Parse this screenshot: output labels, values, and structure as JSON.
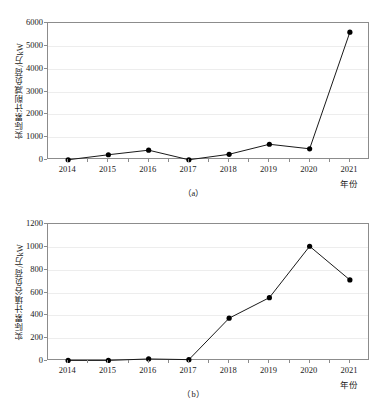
{
  "figure": {
    "background": "#ffffff",
    "line_color": "#1a1a1a",
    "marker_color": "#000000",
    "grid_color": "#ededed",
    "axis_color": "#8c8c8c"
  },
  "chart_data": [
    {
      "id": "panel-a",
      "type": "line",
      "title": "",
      "caption": "（a）",
      "xlabel": "年份",
      "ylabel": "实际累计削减负荷/万kW",
      "categories": [
        "2014",
        "2015",
        "2016",
        "2017",
        "2018",
        "2019",
        "2020",
        "2021"
      ],
      "values": [
        10,
        230,
        430,
        10,
        250,
        690,
        490,
        5600
      ],
      "ylim": [
        0,
        6000
      ],
      "yticks": [
        0,
        1000,
        2000,
        3000,
        4000,
        5000,
        6000
      ],
      "ytick_labels": [
        "0",
        "1000",
        "2000",
        "3000",
        "4000",
        "5000",
        "6000"
      ],
      "grid": true,
      "legend": "none",
      "marker": "circle"
    },
    {
      "id": "panel-b",
      "type": "line",
      "title": "",
      "caption": "（b）",
      "xlabel": "年份",
      "ylabel": "实际累计填谷负荷/万kW",
      "categories": [
        "2014",
        "2015",
        "2016",
        "2017",
        "2018",
        "2019",
        "2020",
        "2021"
      ],
      "values": [
        5,
        5,
        18,
        12,
        375,
        555,
        1005,
        710
      ],
      "ylim": [
        0,
        1200
      ],
      "yticks": [
        0,
        200,
        400,
        600,
        800,
        1000,
        1200
      ],
      "ytick_labels": [
        "0",
        "200",
        "400",
        "600",
        "800",
        "1000",
        "1200"
      ],
      "grid": true,
      "legend": "none",
      "marker": "circle"
    }
  ]
}
